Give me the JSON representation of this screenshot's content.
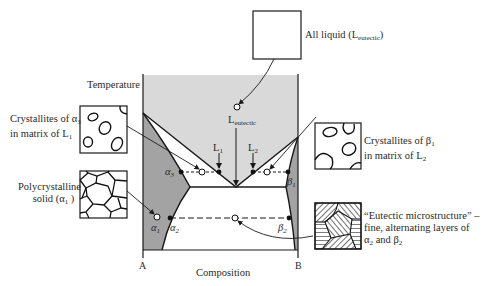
{
  "diagram": {
    "type": "eutectic phase diagram",
    "axis": {
      "y_label": "Temperature",
      "x_label": "Composition",
      "left_end": "A",
      "right_end": "B"
    },
    "points": {
      "eutectic_liquid": "L",
      "eutectic_liquid_sub": "eutectic",
      "L1": "L",
      "L1_sub": "1",
      "L2": "L",
      "L2_sub": "2",
      "alpha3": "α",
      "alpha3_sub": "3",
      "beta1": "β",
      "beta1_sub": "1",
      "alpha1": "α",
      "alpha1_sub": "1",
      "alpha2": "α",
      "alpha2_sub": "2",
      "beta2": "β",
      "beta2_sub": "2"
    },
    "callouts": {
      "all_liquid": {
        "text": "All liquid (L",
        "sub": "eutectic",
        "close": ")"
      },
      "crystallites_alpha": {
        "line1": "Crystallites of α",
        "line1_sub": "3",
        "line2": "in matrix of L",
        "line2_sub": "1"
      },
      "crystallites_beta": {
        "line1": "Crystallites of β",
        "line1_sub": "1",
        "line2": "in matrix of L",
        "line2_sub": "2"
      },
      "polycrystalline": {
        "line1": "Polycrystalline",
        "line2": "solid (α",
        "line2_sub": "1",
        "line2_close": " )"
      },
      "eutectic_micro": {
        "line1": "“Eutectic microstructure” –",
        "line2": "fine, alternating layers of",
        "line3a": "α",
        "line3a_sub": "2",
        "line3b": " and β",
        "line3b_sub": "2"
      }
    },
    "colors": {
      "liquid_region": "#d9d9d9",
      "solid_region": "#a3a3a3",
      "two_phase_region": "#ffffff",
      "line": "#1a1a1a"
    }
  }
}
